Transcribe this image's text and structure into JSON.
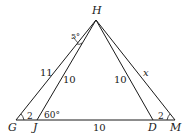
{
  "diagram": {
    "type": "geometry-triangles",
    "points": {
      "H": {
        "label": "H",
        "x": 96,
        "y": 20
      },
      "G": {
        "label": "G",
        "x": 16,
        "y": 120
      },
      "J": {
        "label": "J",
        "x": 37,
        "y": 120
      },
      "D": {
        "label": "D",
        "x": 153,
        "y": 120
      },
      "M": {
        "label": "M",
        "x": 175,
        "y": 120
      }
    },
    "segments": [
      {
        "from": "H",
        "to": "G",
        "label": "11"
      },
      {
        "from": "H",
        "to": "J",
        "label": "10"
      },
      {
        "from": "H",
        "to": "D",
        "label": "10"
      },
      {
        "from": "H",
        "to": "M",
        "label": "x"
      },
      {
        "from": "G",
        "to": "M",
        "label": ""
      },
      {
        "from": "J",
        "to": "D",
        "label": "10"
      }
    ],
    "angles": {
      "GHJ": "5°",
      "HJD": "60°",
      "angle_G": "2",
      "angle_M": "2"
    },
    "text_color": "#1a1a1a",
    "line_color": "#1a1a1a"
  }
}
